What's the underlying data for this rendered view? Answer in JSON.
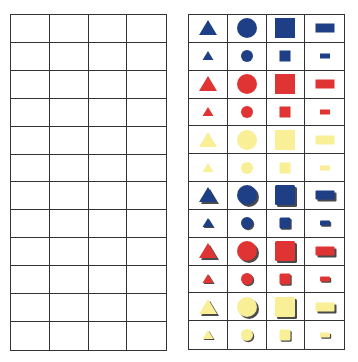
{
  "colors": {
    "blue": "#1e3f85",
    "red": "#e03434",
    "yellow": "#f8ef96",
    "grid_line": "#333333",
    "shadow": "#4a4a4a"
  },
  "left_grid": {
    "rows": 12,
    "cols": 4,
    "content": "empty"
  },
  "right_grid": {
    "rows": 12,
    "cols": 4,
    "columns": [
      "triangle",
      "circle",
      "square",
      "rectangle"
    ],
    "rows_data": [
      {
        "color": "blue",
        "size": "large",
        "style": "flat"
      },
      {
        "color": "blue",
        "size": "small",
        "style": "flat"
      },
      {
        "color": "red",
        "size": "large",
        "style": "flat"
      },
      {
        "color": "red",
        "size": "small",
        "style": "flat"
      },
      {
        "color": "yellow",
        "size": "large",
        "style": "flat"
      },
      {
        "color": "yellow",
        "size": "small",
        "style": "flat"
      },
      {
        "color": "blue",
        "size": "large",
        "style": "thick"
      },
      {
        "color": "blue",
        "size": "small",
        "style": "thick"
      },
      {
        "color": "red",
        "size": "large",
        "style": "thick"
      },
      {
        "color": "red",
        "size": "small",
        "style": "thick"
      },
      {
        "color": "yellow",
        "size": "large",
        "style": "thick"
      },
      {
        "color": "yellow",
        "size": "small",
        "style": "thick"
      }
    ]
  }
}
